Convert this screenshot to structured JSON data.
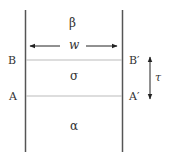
{
  "diagram": {
    "regions": {
      "top": "β",
      "middle": "σ",
      "bottom": "α"
    },
    "points": {
      "left_upper": "B",
      "right_upper": "B′",
      "left_lower": "A",
      "right_lower": "A′"
    },
    "dimensions": {
      "width_label": "w",
      "thickness_label": "τ"
    },
    "colors": {
      "wall": "#555555",
      "interface": "#bbbbbb",
      "arrow": "#222222",
      "text": "#333333"
    }
  }
}
